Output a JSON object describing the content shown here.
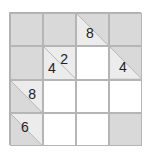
{
  "puzzle": {
    "type": "kakuro",
    "rows": 4,
    "cols": 4,
    "cells": [
      [
        {
          "kind": "block"
        },
        {
          "kind": "block"
        },
        {
          "kind": "clue",
          "across": "8"
        },
        {
          "kind": "block"
        }
      ],
      [
        {
          "kind": "block"
        },
        {
          "kind": "clue",
          "across": "2",
          "down": "4"
        },
        {
          "kind": "empty"
        },
        {
          "kind": "clue",
          "down": "4"
        }
      ],
      [
        {
          "kind": "clue",
          "across": "8"
        },
        {
          "kind": "empty"
        },
        {
          "kind": "empty"
        },
        {
          "kind": "empty"
        }
      ],
      [
        {
          "kind": "clue",
          "across": "6"
        },
        {
          "kind": "empty"
        },
        {
          "kind": "empty"
        },
        {
          "kind": "block"
        }
      ]
    ]
  },
  "colors": {
    "block": "#d9d9d9",
    "clue_light": "#ededed",
    "empty": "#ffffff",
    "border": "#b5b5b5",
    "text": "#222222"
  }
}
